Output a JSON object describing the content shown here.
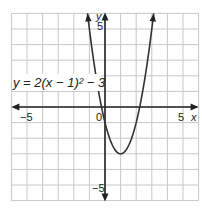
{
  "chart_data": {
    "type": "line",
    "title": "",
    "equation_label": "y = 2(x − 1)² − 3",
    "function": "y = 2(x - 1)^2 - 3",
    "xlabel": "x",
    "ylabel": "y",
    "xlim": [
      -6,
      6
    ],
    "ylim": [
      -6,
      6
    ],
    "grid": true,
    "tick_labels": {
      "x": [
        {
          "value": -5,
          "label": "−5"
        },
        {
          "value": 0,
          "label": "0"
        },
        {
          "value": 5,
          "label": "5"
        }
      ],
      "y": [
        {
          "value": 5,
          "label": "5"
        },
        {
          "value": -5,
          "label": "−5"
        }
      ]
    },
    "vertex": [
      1,
      -3
    ],
    "x_intercepts": [
      -0.22,
      2.22
    ],
    "y_intercept": -1,
    "series": [
      {
        "name": "y = 2(x - 1)^2 - 3",
        "x": [
          -1.12,
          -1,
          -0.5,
          0,
          0.5,
          1,
          1.5,
          2,
          2.5,
          3,
          3.12
        ],
        "y": [
          6,
          5,
          1.5,
          -1,
          -2.5,
          -3,
          -2.5,
          -1,
          1.5,
          5,
          6
        ]
      }
    ],
    "colors": {
      "curve": "#333333",
      "axes": "#222222",
      "grid": "#c8c8c8"
    }
  }
}
